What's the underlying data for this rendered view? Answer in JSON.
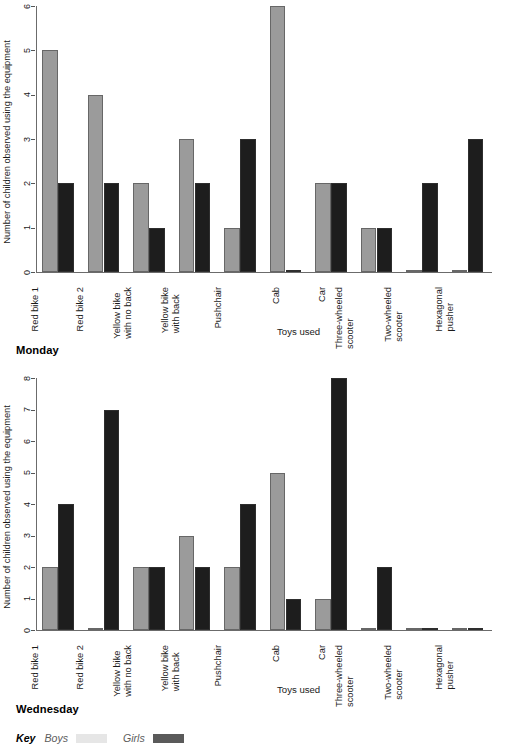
{
  "figure": {
    "ylabel": "Number of children observed using the equipment",
    "xlabel": "Toys used",
    "categories": [
      "Red bike 1",
      "Red bike 2",
      "Yellow bike|with no back",
      "Yellow bike|with back",
      "Pushchair",
      "Cab",
      "Car",
      "Three-wheeled|scooter",
      "Two-wheeled|scooter",
      "Hexagonal|pusher"
    ]
  },
  "key": {
    "title": "Key",
    "boys_label": "Boys",
    "girls_label": "Girls",
    "boys_color": "#e6e6e6",
    "girls_color": "#5a5a5a"
  },
  "colors": {
    "boys_bar": "#9b9b9b",
    "girls_bar": "#1d1d1d",
    "axis": "#6b6b6b",
    "background": "#ffffff"
  },
  "charts": [
    {
      "day_label": "Monday",
      "yticks": [
        "0",
        "1",
        "2",
        "3",
        "4",
        "5",
        "6"
      ],
      "xlabel": "Toys used",
      "ylabel": "Number of children observed using the equipment"
    },
    {
      "day_label": "Wednesday",
      "yticks": [
        "0",
        "1",
        "2",
        "3",
        "4",
        "5",
        "6",
        "7",
        "8"
      ],
      "xlabel": "Toys used",
      "ylabel": "Number of children observed using the equipment"
    }
  ],
  "chart_data": [
    {
      "type": "bar",
      "title": "Monday",
      "xlabel": "Toys used",
      "ylabel": "Number of children observed using the equipment",
      "ylim": [
        0,
        6
      ],
      "yticks": [
        0,
        1,
        2,
        3,
        4,
        5,
        6
      ],
      "grid": false,
      "legend": "bottom",
      "categories": [
        "Red bike 1",
        "Red bike 2",
        "Yellow bike with no back",
        "Yellow bike with back",
        "Pushchair",
        "Cab",
        "Car",
        "Three-wheeled scooter",
        "Two-wheeled scooter",
        "Hexagonal pusher"
      ],
      "series": [
        {
          "name": "Boys",
          "values": [
            5,
            4,
            2,
            3,
            1,
            6,
            2,
            1,
            0,
            0
          ]
        },
        {
          "name": "Girls",
          "values": [
            2,
            2,
            1,
            2,
            3,
            0,
            2,
            1,
            2,
            3
          ]
        }
      ]
    },
    {
      "type": "bar",
      "title": "Wednesday",
      "xlabel": "Toys used",
      "ylabel": "Number of children observed using the equipment",
      "ylim": [
        0,
        8
      ],
      "yticks": [
        0,
        1,
        2,
        3,
        4,
        5,
        6,
        7,
        8
      ],
      "grid": false,
      "legend": "bottom",
      "categories": [
        "Red bike 1",
        "Red bike 2",
        "Yellow bike with no back",
        "Yellow bike with back",
        "Pushchair",
        "Cab",
        "Car",
        "Three-wheeled scooter",
        "Two-wheeled scooter",
        "Hexagonal pusher"
      ],
      "series": [
        {
          "name": "Boys",
          "values": [
            2,
            0,
            2,
            3,
            2,
            5,
            1,
            0,
            0,
            0
          ]
        },
        {
          "name": "Girls",
          "values": [
            4,
            7,
            2,
            2,
            4,
            1,
            8,
            2,
            0,
            0
          ]
        }
      ]
    }
  ]
}
